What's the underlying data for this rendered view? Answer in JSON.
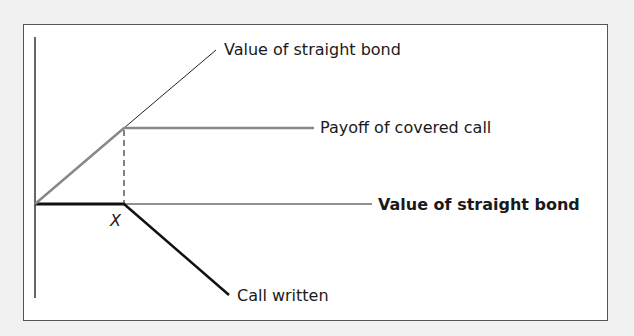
{
  "diagram": {
    "labels": {
      "straight_bond_top": "Value of straight bond",
      "covered_call": "Payoff of covered call",
      "straight_bond_bold": "Value of straight bond",
      "call_written": "Call written",
      "strike": "X"
    },
    "colors": {
      "background": "#f1f1f1",
      "frame": "#555555",
      "axis": "#333333",
      "covered_call_line": "#888888",
      "bond_line": "#222222",
      "call_line": "#111111"
    }
  }
}
